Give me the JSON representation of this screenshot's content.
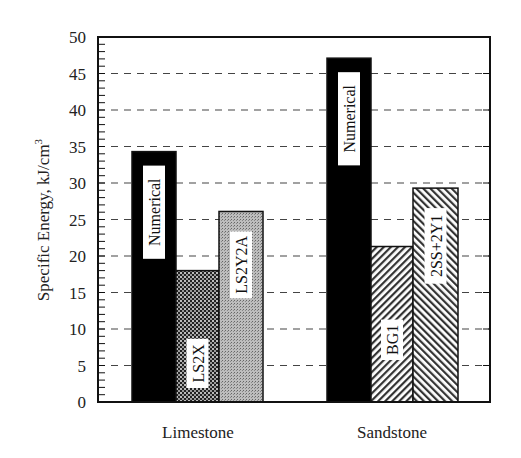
{
  "chart_data": {
    "type": "bar",
    "title": "",
    "xlabel": "",
    "ylabel": "Specific Energy, kJ/cm³",
    "ylim": [
      0,
      50
    ],
    "yticks": [
      0,
      5,
      10,
      15,
      20,
      25,
      30,
      35,
      40,
      45,
      50
    ],
    "grid": {
      "y": true,
      "style": "dashed"
    },
    "legend": "none (bars labeled inline)",
    "groups": [
      {
        "category": "Limestone",
        "bars": [
          {
            "label": "Numerical",
            "value": 34.3,
            "pattern": "solid-black"
          },
          {
            "label": "LS2X",
            "value": 18.0,
            "pattern": "dense-checker"
          },
          {
            "label": "LS2Y2A",
            "value": 26.1,
            "pattern": "light-dots"
          }
        ]
      },
      {
        "category": "Sandstone",
        "bars": [
          {
            "label": "Numerical",
            "value": 47.1,
            "pattern": "solid-black"
          },
          {
            "label": "BG1",
            "value": 21.3,
            "pattern": "diagonal-back"
          },
          {
            "label": "2SS+2Y1",
            "value": 29.3,
            "pattern": "diagonal-forward"
          }
        ]
      }
    ]
  },
  "axis": {
    "ylabel_main": "Specific Energy, kJ/cm",
    "ylabel_sup": "3",
    "tick_labels": [
      "0",
      "5",
      "10",
      "15",
      "20",
      "25",
      "30",
      "35",
      "40",
      "45",
      "50"
    ]
  },
  "categories": [
    "Limestone",
    "Sandstone"
  ],
  "bar_labels": [
    "Numerical",
    "LS2X",
    "LS2Y2A",
    "Numerical",
    "BG1",
    "2SS+2Y1"
  ]
}
